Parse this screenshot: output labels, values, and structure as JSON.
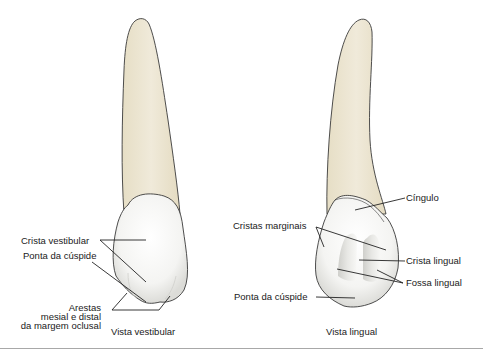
{
  "colors": {
    "root": "#ece5cf",
    "root_shade": "#e2d9bd",
    "crown": "#f7f7f5",
    "crown_shade": "#d8d8d4",
    "outline": "#3a3a3a",
    "leader": "#222222",
    "rule": "#a8a8a8"
  },
  "vestibular": {
    "caption": "Vista vestibular",
    "labels": {
      "crista_vestibular": "Crista vestibular",
      "ponta_cuspide": "Ponta da cúspide",
      "arestas_line1": "Arestas",
      "arestas_line2": "mesial e distal",
      "arestas_line3": "da margem oclusal"
    }
  },
  "lingual": {
    "caption": "Vista lingual",
    "labels": {
      "cingulo": "Cíngulo",
      "cristas_marginais": "Cristas marginais",
      "crista_lingual": "Crista lingual",
      "fossa_lingual": "Fossa lingual",
      "ponta_cuspide": "Ponta da cúspide"
    }
  }
}
